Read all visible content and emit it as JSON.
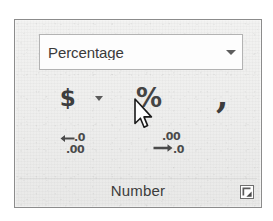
{
  "panel": {
    "group_label": "Number"
  },
  "format_combo": {
    "value": "Percentage",
    "placeholder": "General",
    "arrow_icon": "chevron-down-icon"
  },
  "buttons": {
    "accounting": {
      "glyph": "$",
      "name": "Accounting Number Format",
      "icon": "dollar-icon"
    },
    "accounting_menu": {
      "icon": "chevron-down-icon",
      "name": "Accounting Number Format menu"
    },
    "percent": {
      "glyph": "%",
      "name": "Percent Style",
      "icon": "percent-icon",
      "hovered": true
    },
    "comma": {
      "glyph": ",",
      "name": "Comma Style",
      "icon": "comma-icon"
    },
    "increase_decimal": {
      "name": "Increase Decimal",
      "icon": "increase-decimal-icon",
      "top_text": ".0",
      "bottom_text": ".00"
    },
    "decrease_decimal": {
      "name": "Decrease Decimal",
      "icon": "decrease-decimal-icon",
      "top_text": ".00",
      "bottom_text": ".0"
    }
  },
  "dialog_launcher": {
    "name": "Format Cells dialog launcher",
    "icon": "dialog-launcher-icon"
  },
  "cursor": {
    "icon": "mouse-pointer-icon",
    "x": 132,
    "y": 98
  },
  "colors": {
    "panel_bg": "#eeeeed",
    "panel_border": "#8c8c8c",
    "combo_bg": "#fdfdfd",
    "combo_border": "#b3b3b3",
    "glyph": "#3d3d3d",
    "label": "#3c3c3c"
  }
}
